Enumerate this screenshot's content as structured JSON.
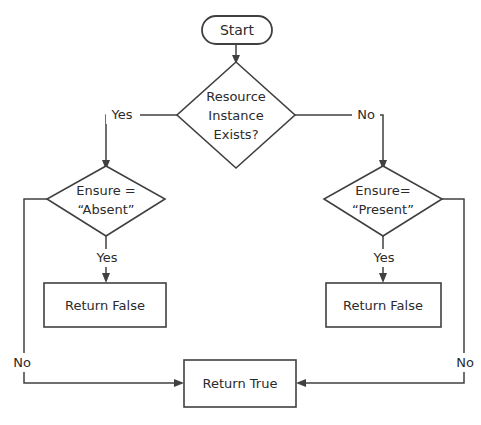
{
  "diagram": {
    "background_color": "#ffffff",
    "line_color": "#404040",
    "text_color": "#2b2b2b",
    "nodes": {
      "start": {
        "label": "Start",
        "shape": "terminator"
      },
      "decision_main": {
        "line1": "Resource",
        "line2": "Instance",
        "line3": "Exists?",
        "shape": "decision"
      },
      "decision_left": {
        "line1": "Ensure =",
        "line2": "“Absent”",
        "shape": "decision"
      },
      "decision_right": {
        "line1": "Ensure=",
        "line2": "“Present”",
        "shape": "decision"
      },
      "return_false_left": {
        "label": "Return False",
        "shape": "process"
      },
      "return_false_right": {
        "label": "Return False",
        "shape": "process"
      },
      "return_true": {
        "label": "Return True",
        "shape": "process"
      }
    },
    "edge_labels": {
      "main_yes": "Yes",
      "main_no": "No",
      "left_yes": "Yes",
      "left_no": "No",
      "right_yes": "Yes",
      "right_no": "No"
    }
  }
}
